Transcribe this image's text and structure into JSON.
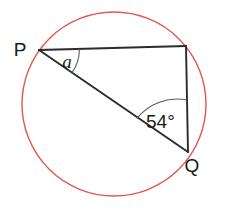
{
  "figure": {
    "type": "circle-geometry-diagram",
    "background_color": "#ffffff",
    "circle": {
      "name": "circumscribed-circle",
      "center_x": 114,
      "center_y": 104,
      "radius": 92,
      "stroke_color": "#e2574c",
      "stroke_width": 1.4,
      "fill": "none"
    },
    "points": {
      "P": {
        "label": "P",
        "x": 39,
        "y": 50,
        "label_x": 20,
        "label_y": 56
      },
      "R": {
        "label": "",
        "x": 186,
        "y": 46,
        "label_x": 0,
        "label_y": 0
      },
      "Q": {
        "label": "Q",
        "x": 188,
        "y": 152,
        "label_x": 192,
        "label_y": 172
      }
    },
    "segments": [
      {
        "name": "segment-PR",
        "from": "P",
        "to": "R",
        "stroke_color": "#2b2b2b",
        "stroke_width": 1.9
      },
      {
        "name": "segment-RQ",
        "from": "R",
        "to": "Q",
        "stroke_color": "#2b2b2b",
        "stroke_width": 1.9
      },
      {
        "name": "segment-QP",
        "from": "Q",
        "to": "P",
        "stroke_color": "#2b2b2b",
        "stroke_width": 1.9
      }
    ],
    "angles": [
      {
        "name": "angle-at-P",
        "vertex": "P",
        "label": "a",
        "label_style": "italic",
        "label_x": 67,
        "label_y": 68,
        "arc_radius": 40,
        "arc_path": "M 79.4 49.0 A 40 40 0 0 1 71.4 73.4",
        "stroke_color": "#5a5a5a",
        "stroke_width": 1.1
      },
      {
        "name": "angle-at-Q",
        "vertex": "Q",
        "label": "54°",
        "label_style": "normal",
        "label_x": 146,
        "label_y": 128,
        "arc_radius": 52,
        "arc_path": "M 136.8 118.4 A 52 52 0 0 1 187.2 100.0",
        "stroke_color": "#5a5a5a",
        "stroke_width": 1.1
      }
    ]
  }
}
